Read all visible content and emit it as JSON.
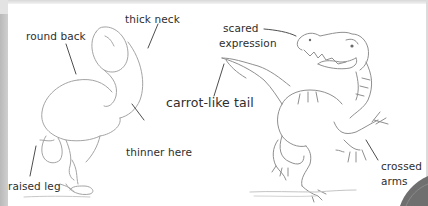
{
  "annotations": {
    "left_figure": {
      "round_back": "round back",
      "thick_neck": "thick neck",
      "thinner_here": "thinner here",
      "raised_leg": "raised leg"
    },
    "center": {
      "carrot_tail": "carrot-like tail"
    },
    "right_figure": {
      "scared_line1": "scared",
      "scared_line2": "expression",
      "crossed_line1": "crossed",
      "crossed_line2": "arms"
    }
  },
  "colors": {
    "page": "#ffffff",
    "ink": "#2e2e2e",
    "sketch": "#9a9a9a",
    "strip": "#c4c4c4",
    "corner": "#6f6f6f"
  }
}
